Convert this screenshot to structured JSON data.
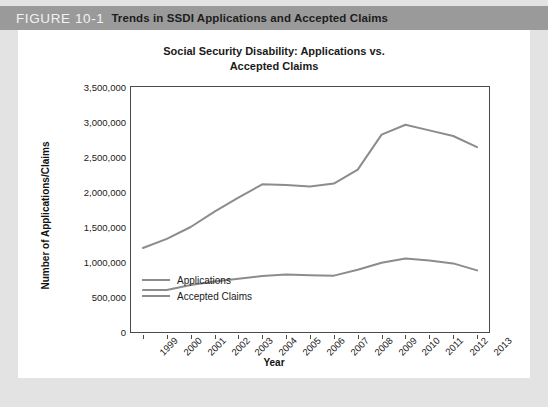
{
  "figure": {
    "number": "FIGURE 10-1",
    "caption": "Trends in SSDI Applications and Accepted Claims"
  },
  "chart_data": {
    "type": "line",
    "title": "Social Security Disability: Applications vs. Accepted Claims",
    "title_line1": "Social Security Disability: Applications vs.",
    "title_line2": "Accepted Claims",
    "xlabel": "Year",
    "ylabel": "Number of Applications/Claims",
    "categories": [
      "1999",
      "2000",
      "2001",
      "2002",
      "2003",
      "2004",
      "2005",
      "2006",
      "2007",
      "2008",
      "2009",
      "2010",
      "2011",
      "2012",
      "2013"
    ],
    "ylim": [
      0,
      3500000
    ],
    "ytick_values": [
      0,
      500000,
      1000000,
      1500000,
      2000000,
      2500000,
      3000000,
      3500000
    ],
    "ytick_labels": [
      "0",
      "500,000",
      "1,000,000",
      "1,500,000",
      "2,000,000",
      "2,500,000",
      "3,000,000",
      "3,500,000"
    ],
    "grid": false,
    "legend_position": "lower-left-inside",
    "series": [
      {
        "name": "Applications",
        "color": "#8c8c8c",
        "values": [
          1200000,
          1330000,
          1500000,
          1720000,
          1920000,
          2110000,
          2100000,
          2080000,
          2120000,
          2320000,
          2820000,
          2960000,
          2880000,
          2800000,
          2640000
        ]
      },
      {
        "name": "Accepted Claims",
        "color": "#8c8c8c",
        "values": [
          600000,
          600000,
          670000,
          720000,
          760000,
          800000,
          820000,
          810000,
          805000,
          890000,
          990000,
          1050000,
          1020000,
          980000,
          880000
        ]
      }
    ]
  },
  "colors": {
    "header_band": "#9a9a9a",
    "page_background": "#e3e3e3",
    "panel_background": "#ffffff",
    "line": "#8c8c8c",
    "axis": "#4a4a4a"
  }
}
